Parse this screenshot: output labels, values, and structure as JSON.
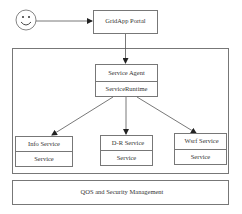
{
  "diagram": {
    "user": {
      "icon": "smiley-face-icon"
    },
    "portal": {
      "label": "GridApp Portal"
    },
    "agent": {
      "top_label": "Service Agent",
      "bottom_label": "ServiceRuntime"
    },
    "services": [
      {
        "top_label": "Info Service",
        "bottom_label": "Service"
      },
      {
        "top_label": "D-R Service",
        "bottom_label": "Service"
      },
      {
        "top_label": "Wsrf Service",
        "bottom_label": "Service"
      }
    ],
    "qos": {
      "label": "QOS and Security Management"
    }
  }
}
